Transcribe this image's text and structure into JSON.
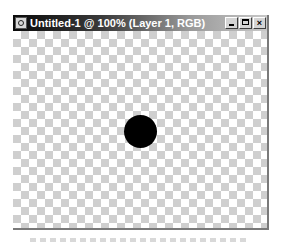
{
  "window": {
    "title": "Untitled-1 @ 100% (Layer 1, RGB)",
    "app_icon": "photoshop-document-icon",
    "buttons": {
      "minimize": "minimize-icon",
      "maximize": "maximize-icon",
      "close_label": "×"
    }
  },
  "canvas": {
    "background": "transparent-checkerboard",
    "shape": {
      "type": "circle",
      "color": "#000000"
    }
  }
}
